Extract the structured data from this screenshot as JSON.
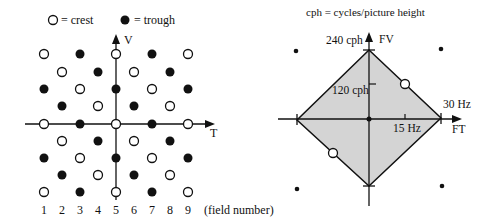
{
  "left": {
    "legend": {
      "crest": "= crest",
      "trough": "= trough"
    },
    "axis_v": "V",
    "axis_t": "T",
    "field_numbers": [
      "1",
      "2",
      "3",
      "4",
      "5",
      "6",
      "7",
      "8",
      "9"
    ],
    "field_label": "(field number)",
    "grid": [
      [
        "O",
        "",
        "T",
        "",
        "O",
        "",
        "T",
        "",
        "O"
      ],
      [
        "",
        "O",
        "",
        "T",
        "",
        "O",
        "",
        "T",
        ""
      ],
      [
        "T",
        "",
        "O",
        "",
        "T",
        "",
        "O",
        "",
        "T"
      ],
      [
        "",
        "T",
        "",
        "O",
        "",
        "T",
        "",
        "O",
        ""
      ],
      [
        "O",
        "",
        "T",
        "",
        "O",
        "",
        "T",
        "",
        "O"
      ],
      [
        "",
        "O",
        "",
        "T",
        "",
        "O",
        "",
        "T",
        ""
      ],
      [
        "T",
        "",
        "O",
        "",
        "T",
        "",
        "O",
        "",
        "T"
      ],
      [
        "",
        "T",
        "",
        "O",
        "",
        "T",
        "",
        "O",
        ""
      ],
      [
        "O",
        "",
        "T",
        "",
        "O",
        "",
        "T",
        "",
        "O"
      ]
    ]
  },
  "right": {
    "caption": "cph = cycles/picture height",
    "axis_fv": "FV",
    "axis_ft": "FT",
    "label_240": "240 cph",
    "label_120": "120 cph",
    "label_30": "30 Hz",
    "label_15": "15 Hz"
  },
  "colors": {
    "ink": "#111111",
    "fill": "#d4d4d4"
  }
}
